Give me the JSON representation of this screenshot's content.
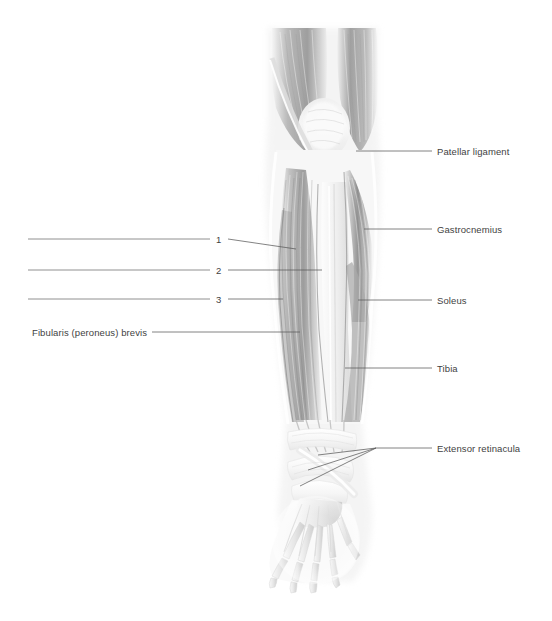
{
  "figure": {
    "view": "anterior",
    "background_color": "#ffffff",
    "text_color": "#3f3f3f",
    "leader_color": "#5a5a5a"
  },
  "right_labels": [
    {
      "id": "patellar-ligament",
      "text": "Patellar ligament",
      "text_x": 437,
      "text_y": 146,
      "leader": "M356,151 L432,151"
    },
    {
      "id": "gastrocnemius",
      "text": "Gastrocnemius",
      "text_x": 437,
      "text_y": 224,
      "leader": "M364,229 L432,229"
    },
    {
      "id": "soleus",
      "text": "Soleus",
      "text_x": 437,
      "text_y": 295,
      "leader": "M358,300 L432,300"
    },
    {
      "id": "tibia",
      "text": "Tibia",
      "text_x": 437,
      "text_y": 363,
      "leader": "M345,368 L432,368"
    },
    {
      "id": "extensor-retinacula",
      "text": "Extensor retinacula",
      "text_x": 437,
      "text_y": 443,
      "leader": "M376,448 L432,448"
    }
  ],
  "retinacula_pointers": [
    "M376,448 L318,455",
    "M376,448 L308,470",
    "M376,448 L300,486"
  ],
  "left_labels": [
    {
      "id": "fibularis-peroneus-brevis",
      "text": "Fibularis (peroneus) brevis",
      "text_x": 32,
      "text_y": 327,
      "leader": "M152,332 L300,332"
    }
  ],
  "numbered_blanks": [
    {
      "number": "1",
      "num_x": 216,
      "num_y": 234,
      "blank": "M28,239 L210,239",
      "leader": "M228,239 L296,249"
    },
    {
      "number": "2",
      "num_x": 216,
      "num_y": 265,
      "blank": "M28,270 L210,270",
      "leader": "M228,270 L322,270"
    },
    {
      "number": "3",
      "num_x": 216,
      "num_y": 294,
      "blank": "M28,299 L210,299",
      "leader": "M228,299 L283,299"
    }
  ]
}
